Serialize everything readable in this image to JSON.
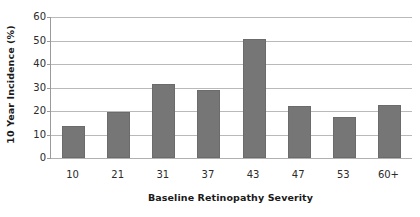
{
  "chart_data": {
    "type": "bar",
    "title": "",
    "xlabel": "Baseline Retinopathy Severity",
    "ylabel": "10 Year Incidence (%)",
    "categories": [
      "10",
      "21",
      "31",
      "37",
      "43",
      "47",
      "53",
      "60+"
    ],
    "values": [
      13.5,
      19.5,
      31.5,
      29.0,
      50.5,
      22.0,
      17.5,
      22.5
    ],
    "ylim": [
      0,
      60
    ],
    "yticks": [
      0,
      10,
      20,
      30,
      40,
      50,
      60
    ],
    "ytick_labels": [
      "0",
      "10",
      "20",
      "30",
      "40",
      "50",
      "60"
    ],
    "grid": true,
    "legend": null,
    "bar_color": "#767676",
    "gridline_color": "#b9b9b9",
    "axis_color": "#9a9a9a",
    "text_color": "#1a1a1a"
  }
}
